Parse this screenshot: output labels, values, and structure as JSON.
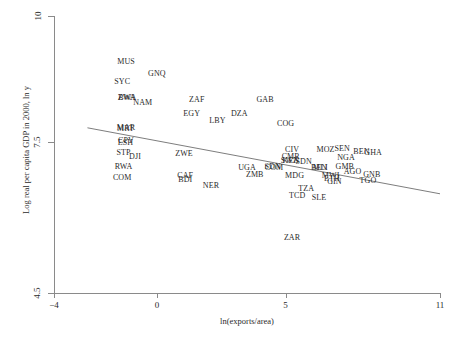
{
  "chart_data": {
    "type": "scatter",
    "title": "",
    "xlabel": "ln(exports/area)",
    "ylabel": "Log real per capita GDP in 2000, ln y",
    "xlim": [
      -4,
      11
    ],
    "ylim": [
      4.5,
      10
    ],
    "xticks": [
      "-4",
      "0",
      "5",
      "11"
    ],
    "xtick_values": [
      -4,
      0,
      5,
      11
    ],
    "yticks": [
      "10",
      "7.5",
      "4.5"
    ],
    "ytick_values": [
      10,
      7.5,
      4.5
    ],
    "grid": false,
    "legend": "none",
    "marker_style": "text-label-only",
    "fit_line": {
      "name": "linear fit",
      "x": [
        -2.7,
        11.0
      ],
      "y": [
        7.78,
        6.47
      ]
    },
    "points": [
      {
        "label": "MUS",
        "x": -1.2,
        "y": 9.08
      },
      {
        "label": "GNQ",
        "x": 0.0,
        "y": 8.85
      },
      {
        "label": "SYC",
        "x": -1.35,
        "y": 8.68
      },
      {
        "label": "BWA",
        "x": -1.15,
        "y": 8.38
      },
      {
        "label": "ZWA",
        "x": -1.18,
        "y": 8.37
      },
      {
        "label": "NAM",
        "x": -0.55,
        "y": 8.27
      },
      {
        "label": "ZAF",
        "x": 1.55,
        "y": 8.33
      },
      {
        "label": "GAB",
        "x": 4.2,
        "y": 8.33
      },
      {
        "label": "EGY",
        "x": 1.35,
        "y": 8.06
      },
      {
        "label": "DZA",
        "x": 3.2,
        "y": 8.05
      },
      {
        "label": "LBY",
        "x": 2.35,
        "y": 7.92
      },
      {
        "label": "COG",
        "x": 5.0,
        "y": 7.86
      },
      {
        "label": "MAR",
        "x": -1.2,
        "y": 7.77
      },
      {
        "label": "MRT",
        "x": -1.22,
        "y": 7.76
      },
      {
        "label": "CPV",
        "x": -1.2,
        "y": 7.51
      },
      {
        "label": "ESH",
        "x": -1.22,
        "y": 7.48
      },
      {
        "label": "STP",
        "x": -1.3,
        "y": 7.28
      },
      {
        "label": "DJI",
        "x": -0.85,
        "y": 7.21
      },
      {
        "label": "ZWE",
        "x": 1.05,
        "y": 7.26
      },
      {
        "label": "CIV",
        "x": 5.25,
        "y": 7.33
      },
      {
        "label": "CMR",
        "x": 5.2,
        "y": 7.2
      },
      {
        "label": "SWZ",
        "x": 5.15,
        "y": 7.13
      },
      {
        "label": "KEN",
        "x": 5.2,
        "y": 7.12
      },
      {
        "label": "SDN",
        "x": 5.7,
        "y": 7.11
      },
      {
        "label": "MOZ",
        "x": 6.55,
        "y": 7.34
      },
      {
        "label": "SEN",
        "x": 7.2,
        "y": 7.36
      },
      {
        "label": "BEN",
        "x": 7.95,
        "y": 7.29
      },
      {
        "label": "GHA",
        "x": 8.4,
        "y": 7.28
      },
      {
        "label": "NGA",
        "x": 7.35,
        "y": 7.19
      },
      {
        "label": "RWA",
        "x": -1.3,
        "y": 7.0
      },
      {
        "label": "UGA",
        "x": 3.5,
        "y": 6.99
      },
      {
        "label": "SDN2",
        "x": 4.5,
        "y": 7.0
      },
      {
        "label": "COM",
        "x": 4.55,
        "y": 6.99
      },
      {
        "label": "BEN2",
        "x": 6.3,
        "y": 6.99
      },
      {
        "label": "MLI",
        "x": 6.35,
        "y": 6.98
      },
      {
        "label": "GMB",
        "x": 7.3,
        "y": 7.0
      },
      {
        "label": "AGO",
        "x": 7.6,
        "y": 6.91
      },
      {
        "label": "GNB",
        "x": 8.35,
        "y": 6.84
      },
      {
        "label": "COM2",
        "x": -1.35,
        "y": 6.78
      },
      {
        "label": "CAF",
        "x": 1.1,
        "y": 6.82
      },
      {
        "label": "BDI",
        "x": 1.1,
        "y": 6.74
      },
      {
        "label": "ZMB",
        "x": 3.8,
        "y": 6.84
      },
      {
        "label": "MDG",
        "x": 5.35,
        "y": 6.82
      },
      {
        "label": "MWI",
        "x": 6.75,
        "y": 6.83
      },
      {
        "label": "ETH",
        "x": 6.8,
        "y": 6.76
      },
      {
        "label": "GIN",
        "x": 6.9,
        "y": 6.71
      },
      {
        "label": "TGO",
        "x": 8.2,
        "y": 6.72
      },
      {
        "label": "NER",
        "x": 2.1,
        "y": 6.63
      },
      {
        "label": "TZA",
        "x": 5.8,
        "y": 6.56
      },
      {
        "label": "TCD",
        "x": 5.45,
        "y": 6.42
      },
      {
        "label": "SLE",
        "x": 6.3,
        "y": 6.39
      },
      {
        "label": "ZAR",
        "x": 5.25,
        "y": 5.6
      }
    ]
  },
  "axes": {
    "x_title": "ln(exports/area)",
    "y_title": "Log real per capita GDP in 2000, ln y",
    "x_tick_labels": [
      "-4",
      "0",
      "5",
      "11"
    ],
    "y_tick_labels": [
      "10",
      "7.5",
      "4.5"
    ]
  },
  "style": {
    "axis_color": "#8a8a8a",
    "text_color": "#2a2a2a",
    "line_color": "#6e6e6e",
    "background": "#ffffff"
  }
}
